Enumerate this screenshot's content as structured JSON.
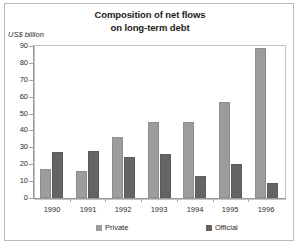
{
  "chart_data": {
    "type": "bar",
    "title": "Composition of net flows on long-term debt",
    "title_line1": "Composition of net flows",
    "title_line2": "on long-term debt",
    "ylabel": "US$ billion",
    "xlabel": "",
    "categories": [
      "1990",
      "1991",
      "1992",
      "1993",
      "1994",
      "1995",
      "1996"
    ],
    "series": [
      {
        "name": "Private",
        "color": "#9c9c9c",
        "values": [
          17,
          16,
          36,
          45,
          45,
          57,
          89
        ]
      },
      {
        "name": "Official",
        "color": "#646464",
        "values": [
          27,
          28,
          24,
          26,
          13,
          20,
          9
        ]
      }
    ],
    "ylim": [
      0,
      90
    ],
    "ytick_labels": [
      "90",
      "80",
      "70",
      "60",
      "50",
      "40",
      "30",
      "20",
      "10",
      "0"
    ],
    "ytick_values": [
      90,
      80,
      70,
      60,
      50,
      40,
      30,
      20,
      10,
      0
    ],
    "ytick_step": 10,
    "grid": true,
    "legend_position": "bottom"
  }
}
